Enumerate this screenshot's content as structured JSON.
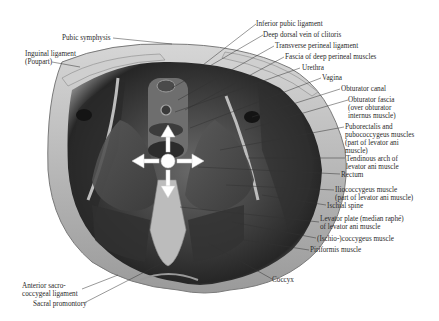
{
  "figure": {
    "labels_left": [
      {
        "text": "Pubic symphysis"
      },
      {
        "text": "Inguinal ligament\n(Poupart)"
      },
      {
        "text": "Anterior sacro-\ncoccygeal ligament"
      },
      {
        "text": "Sacral promontory"
      }
    ],
    "labels_right": [
      {
        "text": "Inferior pubic ligament"
      },
      {
        "text": "Deep dorsal vein of clitoris"
      },
      {
        "text": "Transverse perineal ligament"
      },
      {
        "text": "Fascia of deep perineal muscles"
      },
      {
        "text": "Urethra"
      },
      {
        "text": "Vagina"
      },
      {
        "text": "Obturator canal"
      },
      {
        "text": "Obturator fascia\n(over obturator\ninternus muscle)"
      },
      {
        "text": "Puborectalis and\npubococcygeus muscles\n(part of levator ani\nmuscle)"
      },
      {
        "text": "Tendinous arch of\nlevator ani muscle"
      },
      {
        "text": "Rectum"
      },
      {
        "text": "Iliococcygeus muscle\n(part of levator ani muscle)"
      },
      {
        "text": "Ischial spine"
      },
      {
        "text": "Levator plate (median raphé)\nof levator ani muscle"
      },
      {
        "text": "(Ischio-)coccygeus muscle"
      },
      {
        "text": "Piriformis muscle"
      }
    ],
    "label_bottom": {
      "text": "Coccyx"
    },
    "overlay": {
      "icon": "four-direction-arrows-icon",
      "color": "#ffffff"
    }
  }
}
